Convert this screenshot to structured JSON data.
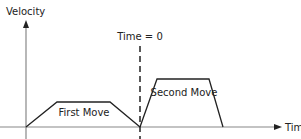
{
  "diagram": {
    "axes": {
      "y_label": "Velocity",
      "x_label": "Time"
    },
    "marker": {
      "label": "Time = 0"
    },
    "moves": [
      {
        "label": "First Move"
      },
      {
        "label": "Second Move"
      }
    ],
    "colors": {
      "axis": "#888888",
      "profile": "#222222",
      "text": "#222222"
    }
  }
}
